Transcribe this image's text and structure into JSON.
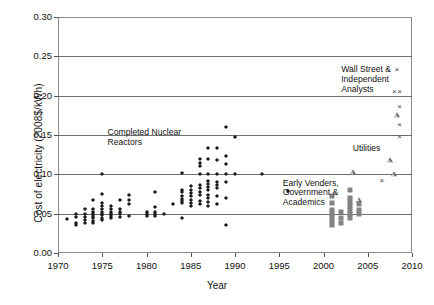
{
  "chart_data": {
    "type": "scatter",
    "title": "",
    "xlabel": "Year",
    "ylabel": "Cost of electricity (2008$/kWh)",
    "xlim": [
      1970,
      2010
    ],
    "ylim": [
      0.0,
      0.3
    ],
    "xticks": [
      "1970",
      "1975",
      "1980",
      "1985",
      "1990",
      "1995",
      "2000",
      "2005",
      "2010"
    ],
    "xtick_values": [
      1970,
      1975,
      1980,
      1985,
      1990,
      1995,
      2000,
      2005,
      2010
    ],
    "yticks": [
      "0.00",
      "0.05",
      "0.10",
      "0.15",
      "0.20",
      "0.25",
      "0.30"
    ],
    "ytick_values": [
      0.0,
      0.05,
      0.1,
      0.15,
      0.2,
      0.25,
      0.3
    ],
    "grid": "horizontal",
    "legend_position": "inline-annotations",
    "annotations": [
      {
        "name": "completed-nuclear-reactors",
        "text": "Completed Nuclear\nReactors",
        "x": 1975.6,
        "y": 0.152
      },
      {
        "name": "wall-street-independent-analysts",
        "text": "Wall Street &\nIndependent\nAnalysts",
        "x": 2002.0,
        "y": 0.232
      },
      {
        "name": "utilities",
        "text": "Utilities",
        "x": 2003.3,
        "y": 0.132
      },
      {
        "name": "early-venders-government-academics",
        "text": "Early Venders,\nGovernment &\nAcademics",
        "x": 1995.4,
        "y": 0.088
      }
    ],
    "series": [
      {
        "name": "Completed Nuclear Reactors",
        "marker": "diamond",
        "color": "#1b1b1b",
        "points": [
          [
            1971.0,
            0.043
          ],
          [
            1972.0,
            0.05
          ],
          [
            1972.0,
            0.046
          ],
          [
            1972.0,
            0.038
          ],
          [
            1972.0,
            0.036
          ],
          [
            1973.0,
            0.056
          ],
          [
            1973.0,
            0.05
          ],
          [
            1973.0,
            0.046
          ],
          [
            1973.0,
            0.042
          ],
          [
            1973.0,
            0.038
          ],
          [
            1974.0,
            0.068
          ],
          [
            1974.0,
            0.056
          ],
          [
            1974.0,
            0.052
          ],
          [
            1974.0,
            0.05
          ],
          [
            1974.0,
            0.047
          ],
          [
            1974.0,
            0.044
          ],
          [
            1974.0,
            0.041
          ],
          [
            1974.0,
            0.038
          ],
          [
            1975.0,
            0.1
          ],
          [
            1975.0,
            0.075
          ],
          [
            1975.0,
            0.064
          ],
          [
            1975.0,
            0.06
          ],
          [
            1975.0,
            0.056
          ],
          [
            1975.0,
            0.052
          ],
          [
            1975.0,
            0.05
          ],
          [
            1975.0,
            0.048
          ],
          [
            1975.0,
            0.045
          ],
          [
            1975.0,
            0.042
          ],
          [
            1976.0,
            0.06
          ],
          [
            1976.0,
            0.056
          ],
          [
            1976.0,
            0.052
          ],
          [
            1976.0,
            0.05
          ],
          [
            1976.0,
            0.047
          ],
          [
            1976.0,
            0.044
          ],
          [
            1977.0,
            0.068
          ],
          [
            1977.0,
            0.056
          ],
          [
            1977.0,
            0.052
          ],
          [
            1977.0,
            0.049
          ],
          [
            1977.0,
            0.046
          ],
          [
            1978.0,
            0.074
          ],
          [
            1978.0,
            0.068
          ],
          [
            1978.0,
            0.062
          ],
          [
            1978.0,
            0.047
          ],
          [
            1980.0,
            0.052
          ],
          [
            1980.0,
            0.049
          ],
          [
            1980.0,
            0.047
          ],
          [
            1981.0,
            0.078
          ],
          [
            1981.0,
            0.058
          ],
          [
            1981.0,
            0.052
          ],
          [
            1981.0,
            0.05
          ],
          [
            1981.0,
            0.047
          ],
          [
            1982.0,
            0.05
          ],
          [
            1983.0,
            0.062
          ],
          [
            1984.0,
            0.102
          ],
          [
            1984.0,
            0.08
          ],
          [
            1984.0,
            0.077
          ],
          [
            1984.0,
            0.072
          ],
          [
            1984.0,
            0.069
          ],
          [
            1984.0,
            0.066
          ],
          [
            1984.0,
            0.063
          ],
          [
            1984.0,
            0.044
          ],
          [
            1985.0,
            0.085
          ],
          [
            1985.0,
            0.08
          ],
          [
            1985.0,
            0.076
          ],
          [
            1985.0,
            0.072
          ],
          [
            1985.0,
            0.068
          ],
          [
            1985.0,
            0.064
          ],
          [
            1985.0,
            0.06
          ],
          [
            1986.0,
            0.12
          ],
          [
            1986.0,
            0.115
          ],
          [
            1986.0,
            0.11
          ],
          [
            1986.0,
            0.1
          ],
          [
            1986.0,
            0.086
          ],
          [
            1986.0,
            0.082
          ],
          [
            1986.0,
            0.078
          ],
          [
            1986.0,
            0.074
          ],
          [
            1986.0,
            0.066
          ],
          [
            1986.0,
            0.062
          ],
          [
            1987.0,
            0.133
          ],
          [
            1987.0,
            0.12
          ],
          [
            1987.0,
            0.1
          ],
          [
            1987.0,
            0.092
          ],
          [
            1987.0,
            0.088
          ],
          [
            1987.0,
            0.084
          ],
          [
            1987.0,
            0.08
          ],
          [
            1987.0,
            0.074
          ],
          [
            1987.0,
            0.07
          ],
          [
            1987.0,
            0.065
          ],
          [
            1987.0,
            0.06
          ],
          [
            1988.0,
            0.134
          ],
          [
            1988.0,
            0.118
          ],
          [
            1988.0,
            0.1
          ],
          [
            1988.0,
            0.09
          ],
          [
            1988.0,
            0.086
          ],
          [
            1988.0,
            0.082
          ],
          [
            1988.0,
            0.072
          ],
          [
            1988.0,
            0.062
          ],
          [
            1989.0,
            0.16
          ],
          [
            1989.0,
            0.123
          ],
          [
            1989.0,
            0.113
          ],
          [
            1989.0,
            0.1
          ],
          [
            1989.0,
            0.09
          ],
          [
            1989.0,
            0.07
          ],
          [
            1989.0,
            0.036
          ],
          [
            1990.0,
            0.148
          ],
          [
            1990.0,
            0.1
          ],
          [
            1993.0,
            0.1
          ],
          [
            1996.0,
            0.079
          ]
        ]
      },
      {
        "name": "Early Venders, Government & Academics",
        "marker": "square",
        "color": "#838383",
        "points": [
          [
            2001.0,
            0.072
          ],
          [
            2001.0,
            0.063
          ],
          [
            2001.0,
            0.055
          ],
          [
            2001.0,
            0.05
          ],
          [
            2001.0,
            0.046
          ],
          [
            2001.0,
            0.041
          ],
          [
            2001.0,
            0.035
          ],
          [
            2002.0,
            0.052
          ],
          [
            2002.0,
            0.044
          ],
          [
            2002.0,
            0.038
          ],
          [
            2003.0,
            0.08
          ],
          [
            2003.0,
            0.07
          ],
          [
            2003.0,
            0.065
          ],
          [
            2003.0,
            0.06
          ],
          [
            2003.0,
            0.055
          ],
          [
            2003.0,
            0.05
          ],
          [
            2003.0,
            0.045
          ],
          [
            2004.0,
            0.062
          ],
          [
            2004.0,
            0.055
          ],
          [
            2004.0,
            0.05
          ]
        ]
      },
      {
        "name": "Utilities",
        "marker": "triangle",
        "color": "#6e6e6e",
        "points": [
          [
            2003.3,
            0.103
          ],
          [
            2004.0,
            0.068
          ],
          [
            2007.5,
            0.118
          ],
          [
            2008.0,
            0.1
          ],
          [
            2008.3,
            0.175
          ]
        ]
      },
      {
        "name": "Wall Street & Independent Analysts",
        "marker": "x",
        "color": "#3a3a3a",
        "points": [
          [
            2006.6,
            0.092
          ],
          [
            2008.3,
            0.232
          ],
          [
            2008.0,
            0.205
          ],
          [
            2008.6,
            0.205
          ],
          [
            2008.6,
            0.185
          ],
          [
            2008.6,
            0.163
          ],
          [
            2008.6,
            0.148
          ]
        ]
      }
    ]
  }
}
